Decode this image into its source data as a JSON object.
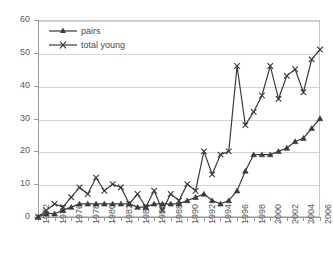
{
  "chart_data": {
    "type": "line",
    "title": "",
    "xlabel": "",
    "ylabel": "",
    "ylim": [
      0,
      60
    ],
    "ytick_labels": [
      "0",
      "10",
      "20",
      "30",
      "40",
      "50",
      "60"
    ],
    "yticks": [
      0,
      10,
      20,
      30,
      40,
      50,
      60
    ],
    "grid": true,
    "legend_position": "top-left",
    "x": [
      1972,
      1973,
      1974,
      1975,
      1976,
      1977,
      1978,
      1979,
      1980,
      1981,
      1982,
      1983,
      1984,
      1985,
      1986,
      1987,
      1988,
      1989,
      1990,
      1991,
      1992,
      1993,
      1994,
      1995,
      1996,
      1997,
      1998,
      1999,
      2000,
      2001,
      2002,
      2003,
      2004,
      2005,
      2006
    ],
    "xtick_labels": [
      "1972",
      "1974",
      "1976",
      "1978",
      "1980",
      "1982",
      "1984",
      "1986",
      "1988",
      "1990",
      "1992",
      "1994",
      "1996",
      "1998",
      "2000",
      "2002",
      "2004",
      "2006"
    ],
    "series": [
      {
        "name": "pairs",
        "marker": "triangle",
        "color": "#3a3a3a",
        "values": [
          0,
          1,
          1,
          2,
          3,
          4,
          4,
          4,
          4,
          4,
          4,
          4,
          3,
          3,
          4,
          4,
          4,
          4,
          5,
          6,
          7,
          5,
          4,
          5,
          8,
          14,
          19,
          19,
          19,
          20,
          21,
          23,
          24,
          27,
          30
        ]
      },
      {
        "name": "total young",
        "marker": "x",
        "color": "#3a3a3a",
        "values": [
          0,
          2,
          4,
          3,
          6,
          9,
          7,
          12,
          8,
          10,
          9,
          4,
          7,
          3,
          8,
          2,
          7,
          5,
          10,
          8,
          20,
          13,
          19,
          20,
          46,
          28,
          32,
          37,
          46,
          36,
          43,
          45,
          38,
          48,
          51
        ]
      }
    ]
  },
  "legend": {
    "items": [
      {
        "label": "pairs",
        "marker": "triangle"
      },
      {
        "label": "total young",
        "marker": "x"
      }
    ]
  }
}
